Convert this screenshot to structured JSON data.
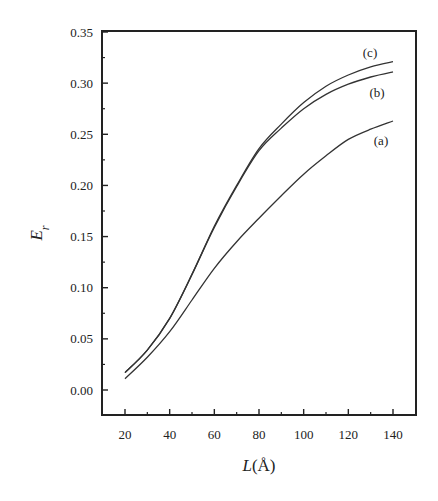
{
  "chart_data": {
    "type": "line",
    "title": "",
    "xlabel": "L(Å)",
    "ylabel": "E_r",
    "xlim": [
      10,
      150
    ],
    "ylim": [
      -0.025,
      0.35
    ],
    "xticks": [
      20,
      40,
      60,
      80,
      100,
      120,
      140
    ],
    "xtick_labels": [
      "20",
      "40",
      "60",
      "80",
      "100",
      "120",
      "140"
    ],
    "xminor_ticks": [
      30,
      50,
      70,
      90,
      110,
      130
    ],
    "yticks": [
      0.0,
      0.05,
      0.1,
      0.15,
      0.2,
      0.25,
      0.3,
      0.35
    ],
    "ytick_labels": [
      "0.00",
      "0.05",
      "0.10",
      "0.15",
      "0.20",
      "0.25",
      "0.30",
      "0.35"
    ],
    "yminor_ticks": [
      0.025,
      0.075,
      0.125,
      0.175,
      0.225,
      0.275,
      0.325
    ],
    "grid": false,
    "legend": "inline labels near curve ends",
    "x": [
      20,
      30,
      40,
      50,
      60,
      70,
      80,
      90,
      100,
      110,
      120,
      130,
      140
    ],
    "series": [
      {
        "name": "(a)",
        "values": [
          0.011,
          0.032,
          0.057,
          0.088,
          0.119,
          0.145,
          0.168,
          0.19,
          0.211,
          0.229,
          0.245,
          0.255,
          0.263
        ],
        "label_pos": [
          381,
          141
        ]
      },
      {
        "name": "(b)",
        "values": [
          0.017,
          0.039,
          0.07,
          0.113,
          0.159,
          0.199,
          0.234,
          0.256,
          0.275,
          0.289,
          0.299,
          0.306,
          0.311
        ],
        "label_pos": [
          377,
          93
        ]
      },
      {
        "name": "(c)",
        "values": [
          0.017,
          0.039,
          0.07,
          0.113,
          0.16,
          0.2,
          0.236,
          0.26,
          0.281,
          0.297,
          0.308,
          0.316,
          0.321
        ],
        "label_pos": [
          370,
          53
        ]
      }
    ]
  },
  "colors": {
    "frame": "#222222",
    "curve": "#333333",
    "text": "#222222"
  }
}
